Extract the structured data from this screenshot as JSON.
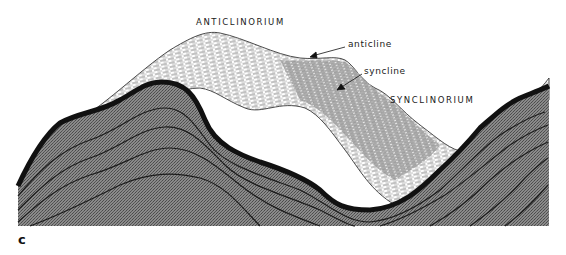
{
  "figure": {
    "panel_label": "c",
    "labels": {
      "anticlinorium": "ANTICLINORIUM",
      "anticline": "anticline",
      "syncline": "syncline",
      "synclinorium": "SYNCLINORIUM"
    },
    "colors": {
      "background": "#ffffff",
      "cross_section_fill": "#7a7a7a",
      "stipple_light": "#9a9a9a",
      "top_layer": "#111111",
      "bedding_lines": "#1c1c1c",
      "surface_hatch": "#2a2a2a"
    }
  }
}
